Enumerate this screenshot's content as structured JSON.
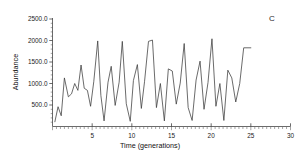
{
  "panel": {
    "label": "C"
  },
  "chart_data": {
    "type": "line",
    "title": "",
    "xlabel": "Time (generations)",
    "ylabel": "Abundance",
    "xlim": [
      0,
      30
    ],
    "ylim": [
      0,
      2500
    ],
    "xticks": [
      5,
      10,
      15,
      20,
      25,
      30
    ],
    "xticklabels": [
      "5",
      "10",
      "15",
      "20",
      "25",
      "30"
    ],
    "yticks": [
      500,
      1000,
      1500,
      2000,
      2500
    ],
    "yticklabels": [
      "500.0",
      "1000.0",
      "1500.0",
      "2000.0",
      "2500.0"
    ],
    "grid": false,
    "legend": false,
    "minor_ticks": true,
    "series": [
      {
        "name": "Abundance",
        "color": "#3a3a3a",
        "x": [
          0.3,
          0.7,
          1.1,
          1.5,
          2.0,
          2.4,
          2.8,
          3.2,
          3.6,
          4.0,
          4.4,
          4.8,
          5.2,
          5.7,
          6.1,
          6.5,
          7.0,
          7.4,
          7.9,
          8.4,
          8.8,
          9.3,
          9.8,
          10.2,
          10.7,
          11.2,
          11.6,
          12.1,
          12.6,
          13.1,
          13.6,
          14.1,
          14.6,
          15.1,
          15.6,
          16.1,
          16.6,
          17.1,
          17.6,
          18.1,
          18.6,
          19.1,
          19.6,
          20.1,
          20.6,
          21.1,
          21.6,
          22.1,
          22.6,
          23.1,
          23.6,
          24.1,
          25.0
        ],
        "y": [
          110,
          460,
          250,
          1130,
          690,
          760,
          1000,
          840,
          1430,
          890,
          840,
          470,
          1040,
          1990,
          720,
          130,
          1030,
          1400,
          490,
          1030,
          1980,
          530,
          120,
          1070,
          1440,
          420,
          1040,
          1980,
          2010,
          440,
          1000,
          130,
          1340,
          1290,
          520,
          1010,
          1930,
          440,
          140,
          1080,
          1520,
          400,
          1020,
          2040,
          470,
          1000,
          140,
          1310,
          1130,
          570,
          1000,
          1830,
          1830
        ]
      }
    ]
  }
}
